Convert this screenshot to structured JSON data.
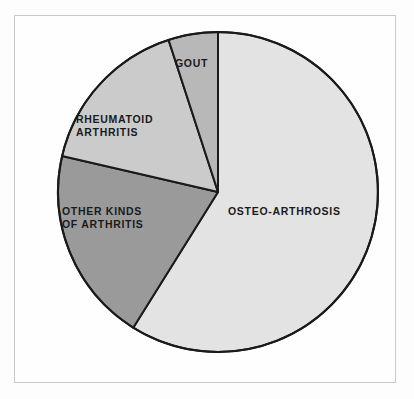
{
  "chart_data": {
    "type": "pie",
    "title": "",
    "subtitle": "",
    "xlabel": "",
    "ylabel": "",
    "legend_position": "none",
    "grid": false,
    "labels_on_slices": true,
    "categories": [
      "OSTEO-ARTHROSIS",
      "OTHER KINDS OF ARTHRITIS",
      "RHEUMATOID ARTHRITIS",
      "GOUT"
    ],
    "values": [
      59,
      20,
      16,
      5
    ],
    "units": "percent",
    "slices": [
      {
        "label": "OSTEO-ARTHROSIS",
        "label_lines": [
          "OSTEO-ARTHROSIS"
        ],
        "value": 59,
        "start_angle_deg": 0,
        "end_angle_deg": 212,
        "color": "#e3e3e3"
      },
      {
        "label": "OTHER KINDS OF ARTHRITIS",
        "label_lines": [
          "OTHER KINDS",
          "OF ARTHRITIS"
        ],
        "value": 20,
        "start_angle_deg": 212,
        "end_angle_deg": 283,
        "color": "#9a9a9a"
      },
      {
        "label": "RHEUMATOID ARTHRITIS",
        "label_lines": [
          "RHEUMATOID",
          "ARTHRITIS"
        ],
        "value": 16,
        "start_angle_deg": 283,
        "end_angle_deg": 342,
        "color": "#cbcbcb"
      },
      {
        "label": "GOUT",
        "label_lines": [
          "GOUT"
        ],
        "value": 5,
        "start_angle_deg": 342,
        "end_angle_deg": 360,
        "color": "#b8b8b8"
      }
    ],
    "geometry": {
      "center_x": 218,
      "center_y": 192,
      "radius": 160
    },
    "style": {
      "outline_color": "#1a1a1a",
      "outline_width": 2,
      "background": "#fefefe",
      "frame_color": "#c9c9c9",
      "label_color": "#1a1a1a"
    }
  },
  "labels": {
    "osteo": "OSTEO-ARTHROSIS",
    "gout": "GOUT",
    "rheumatoid_line1": "RHEUMATOID",
    "rheumatoid_line2": "ARTHRITIS",
    "other_line1": "OTHER KINDS",
    "other_line2": "OF ARTHRITIS"
  }
}
